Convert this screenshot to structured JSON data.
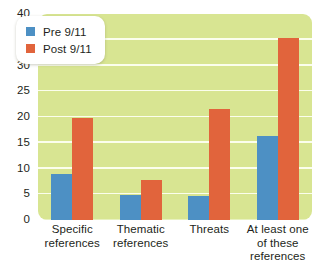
{
  "chart_data": {
    "type": "bar",
    "title": "",
    "xlabel": "",
    "ylabel": "",
    "ylim": [
      0,
      40
    ],
    "yticks": [
      0,
      5,
      10,
      15,
      20,
      25,
      30,
      35,
      40
    ],
    "ytick_labels": [
      "0",
      "5",
      "10",
      "15",
      "20",
      "25",
      "30",
      "35",
      "40"
    ],
    "grid": true,
    "legend_position": "top-left",
    "categories": [
      "Specific\nreferences",
      "Thematic\nreferences",
      "Threats",
      "At least one\nof these\nreferences"
    ],
    "category_lines": [
      [
        "Specific",
        "references"
      ],
      [
        "Thematic",
        "references"
      ],
      [
        "Threats"
      ],
      [
        "At least one",
        "of these",
        "references"
      ]
    ],
    "series": [
      {
        "name": "Pre 9/11",
        "color": "#4d90c4",
        "values": [
          8.9,
          4.9,
          4.7,
          16.3
        ]
      },
      {
        "name": "Post 9/11",
        "color": "#e1643c",
        "values": [
          19.9,
          7.7,
          21.6,
          35.3
        ]
      }
    ]
  },
  "colors": {
    "plot_background": "#d8e592",
    "gridline": "#fdfff2",
    "page_background": "#ffffff",
    "text": "#231f20",
    "series_pre": "#4d90c4",
    "series_post": "#e1643c",
    "legend_background": "#ffffff"
  },
  "legend": {
    "items": [
      {
        "label": "Pre 9/11",
        "swatch": "pre"
      },
      {
        "label": "Post 9/11",
        "swatch": "post"
      }
    ]
  }
}
